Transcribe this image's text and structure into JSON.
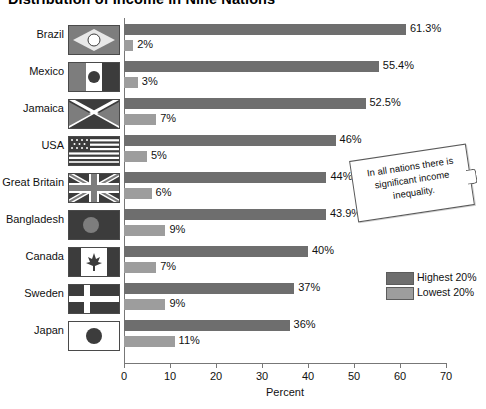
{
  "chart_data": {
    "type": "bar",
    "orientation": "horizontal",
    "title": "Distribution of Income in Nine Nations",
    "xlabel": "Percent",
    "ylabel": "",
    "xlim": [
      0,
      70
    ],
    "xticks": [
      0,
      10,
      20,
      30,
      40,
      50,
      60,
      70
    ],
    "grid": false,
    "legend_position": "right",
    "categories": [
      "Brazil",
      "Mexico",
      "Jamaica",
      "USA",
      "Great Britain",
      "Bangladesh",
      "Canada",
      "Sweden",
      "Japan"
    ],
    "series": [
      {
        "name": "Highest 20%",
        "color": "#6e6e6e",
        "values": [
          61.3,
          55.4,
          52.5,
          46,
          44,
          43.9,
          40,
          37,
          36
        ],
        "labels": [
          "61.3%",
          "55.4%",
          "52.5%",
          "46%",
          "44%",
          "43.9%",
          "40%",
          "37%",
          "36%"
        ]
      },
      {
        "name": "Lowest 20%",
        "color": "#9d9d9d",
        "values": [
          2,
          3,
          7,
          5,
          6,
          9,
          7,
          9,
          11
        ],
        "labels": [
          "2%",
          "3%",
          "7%",
          "5%",
          "6%",
          "9%",
          "7%",
          "9%",
          "11%"
        ]
      }
    ],
    "annotations": [
      {
        "text": "In all nations there is significant income inequality."
      }
    ]
  },
  "legend": {
    "items": [
      {
        "label": "Highest 20%",
        "color": "#6e6e6e"
      },
      {
        "label": "Lowest 20%",
        "color": "#9d9d9d"
      }
    ]
  },
  "flags": {
    "Brazil": "flag-brazil-icon",
    "Mexico": "flag-mexico-icon",
    "Jamaica": "flag-jamaica-icon",
    "USA": "flag-usa-icon",
    "Great Britain": "flag-great-britain-icon",
    "Bangladesh": "flag-bangladesh-icon",
    "Canada": "flag-canada-icon",
    "Sweden": "flag-sweden-icon",
    "Japan": "flag-japan-icon"
  }
}
